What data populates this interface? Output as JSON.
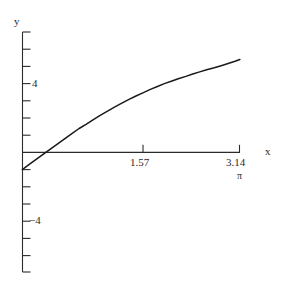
{
  "chart_data": {
    "type": "line",
    "title": "",
    "subtitle": "",
    "xlabel": "x",
    "ylabel": "y",
    "xlim": [
      -0.18,
      3.45
    ],
    "ylim": [
      -8.0,
      7.3
    ],
    "grid": false,
    "legend": null,
    "x_ticks": [
      {
        "value": 1.57,
        "label": "1.57"
      },
      {
        "value": 3.14,
        "label": "3.14"
      }
    ],
    "x_tick_sublabel": "π",
    "y_ticks": [
      {
        "value": 4,
        "label": "4"
      },
      {
        "value": -4,
        "label": "−4"
      }
    ],
    "y_unlabeled_tick_values": [
      7,
      6,
      5,
      3,
      2,
      1,
      -1,
      -2,
      -3,
      -5,
      -6,
      -7
    ],
    "axes_color": "#2b2b2b",
    "curve_color": "#1a1a1a",
    "background": "#ffffff",
    "series": [
      {
        "name": "y = 2x + sin(x) - 1",
        "x": [
          0.0,
          0.1,
          0.2,
          0.31,
          0.41,
          0.51,
          0.61,
          0.72,
          0.82,
          0.92,
          1.02,
          1.13,
          1.23,
          1.33,
          1.43,
          1.54,
          1.64,
          1.74,
          1.84,
          1.95,
          2.05,
          2.15,
          2.25,
          2.36,
          2.46,
          2.56,
          2.66,
          2.77,
          2.87,
          2.97,
          3.07,
          3.14
        ],
        "y": [
          -1.0,
          -0.7,
          -0.4,
          -0.08,
          0.21,
          0.5,
          0.79,
          1.1,
          1.39,
          1.63,
          1.89,
          2.17,
          2.4,
          2.63,
          2.85,
          3.08,
          3.28,
          3.46,
          3.65,
          3.83,
          4.0,
          4.14,
          4.28,
          4.42,
          4.56,
          4.68,
          4.8,
          4.92,
          5.04,
          5.17,
          5.3,
          5.4
        ]
      }
    ],
    "notes": {
      "curve_start_value": -1.0,
      "curve_value_at_1_57": 3.0,
      "curve_end_value": 6.8
    }
  },
  "labels": {
    "y_axis": "y",
    "x_axis": "x",
    "y_tick_4": "4",
    "y_tick_neg4": "−4",
    "x_tick_157": "1.57",
    "x_tick_314": "3.14",
    "pi_symbol": "π"
  }
}
